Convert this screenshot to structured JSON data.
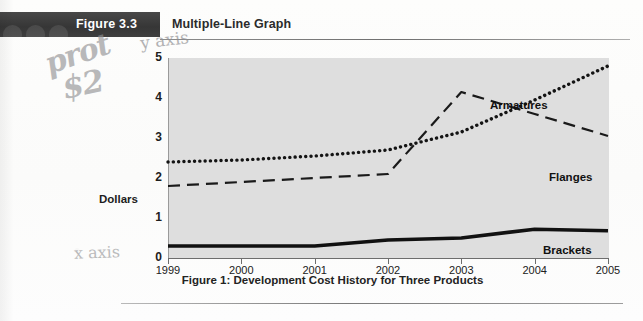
{
  "header": {
    "figure_number": "Figure 3.3",
    "figure_title": "Multiple-Line Graph",
    "band_color": "#3d3d3d"
  },
  "annotations": {
    "scrawl_line1": "prot",
    "scrawl_line2": "$2",
    "y_axis_note": "y axis",
    "x_axis_note": "x axis",
    "ink_color": "#8f8f92"
  },
  "caption": "Figure 1: Development Cost History for Three Products",
  "chart_data": {
    "type": "line",
    "title": "Figure 1: Development Cost History for Three Products",
    "xlabel": "",
    "ylabel": "Dollars",
    "x": [
      "1999",
      "2000",
      "2001",
      "2002",
      "2003",
      "2004",
      "2005"
    ],
    "xlim": [
      "1999",
      "2005"
    ],
    "ylim": [
      0,
      5
    ],
    "y_ticks": [
      "0",
      "1",
      "2",
      "3",
      "4",
      "5"
    ],
    "grid": false,
    "plot_background": "#dedede",
    "legend_position": "inline-right-labels",
    "series": [
      {
        "name": "Armatures",
        "style": "dotted",
        "color": "#141414",
        "values": [
          2.4,
          2.45,
          2.55,
          2.7,
          3.15,
          3.95,
          4.8
        ]
      },
      {
        "name": "Flanges",
        "style": "dashed",
        "color": "#1a1a1a",
        "values": [
          1.8,
          1.9,
          2.0,
          2.1,
          4.15,
          3.6,
          3.05
        ]
      },
      {
        "name": "Brackets",
        "style": "solid-thick",
        "color": "#111111",
        "values": [
          0.3,
          0.3,
          0.3,
          0.45,
          0.5,
          0.72,
          0.68
        ]
      }
    ]
  }
}
